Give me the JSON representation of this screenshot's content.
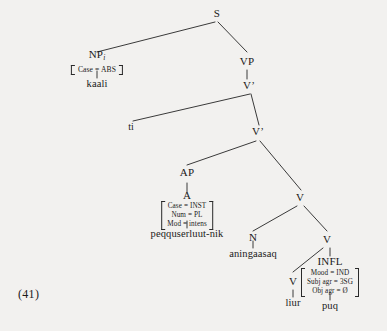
{
  "figure": {
    "example_number": "(41)",
    "type": "x-bar-syntax-tree",
    "language_note": ""
  },
  "nodes": {
    "s": "S",
    "np": "NP",
    "np_index": "i",
    "vp": "VP",
    "vbar_upper": "V’",
    "vbar_lower": "V’",
    "trace": "t",
    "trace_index": "i",
    "ap": "AP",
    "a": "A",
    "v_mid": "V",
    "n": "N",
    "v_inner": "V",
    "v_leafnode": "V",
    "infl": "INFL"
  },
  "features": {
    "np": {
      "rows": [
        "Case = ABS"
      ]
    },
    "a": {
      "rows": [
        "Case = INST",
        "Num = PL",
        "Mod = intens"
      ]
    },
    "infl": {
      "rows": [
        "Mood = IND",
        "Subj agr = 3SG",
        "Obj agr = Ø"
      ]
    }
  },
  "terminals": {
    "np_word": "kaali",
    "a_word": "peqquserluut-nik",
    "n_word": "aningaasaq",
    "v_word": "liur",
    "infl_word": "puq"
  },
  "colors": {
    "background": "#f2f1ef",
    "ink": "#1a1a1a",
    "line": "#3a3a3a"
  }
}
